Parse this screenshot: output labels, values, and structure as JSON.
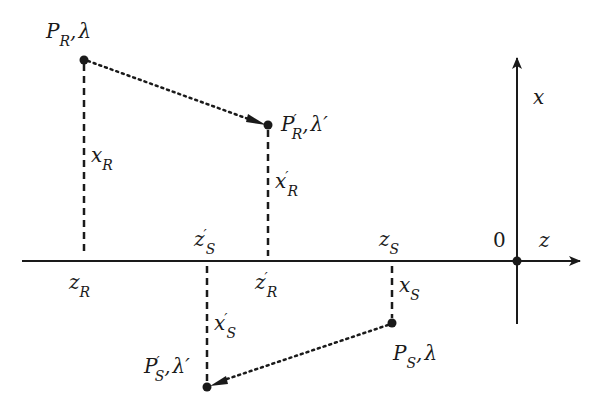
{
  "diagram": {
    "type": "coordinate-transform",
    "colors": {
      "ink": "#1a1a1a",
      "background": "#ffffff"
    },
    "axes": {
      "horizontal": {
        "label": "z"
      },
      "vertical": {
        "label": "x"
      },
      "origin": {
        "label": "0"
      }
    },
    "points": {
      "PR": {
        "base": "P",
        "prime": "",
        "sub": "R",
        "param": "λ"
      },
      "PRp": {
        "base": "P",
        "prime": "′",
        "sub": "R",
        "param": "λ′"
      },
      "PS": {
        "base": "P",
        "prime": "",
        "sub": "S",
        "param": "λ"
      },
      "PSp": {
        "base": "P",
        "prime": "′",
        "sub": "S",
        "param": "λ′"
      }
    },
    "coords": {
      "xR": {
        "base": "x",
        "prime": "",
        "sub": "R"
      },
      "xRp": {
        "base": "x",
        "prime": "′",
        "sub": "R"
      },
      "xS": {
        "base": "x",
        "prime": "",
        "sub": "S"
      },
      "xSp": {
        "base": "x",
        "prime": "′",
        "sub": "S"
      },
      "zR": {
        "base": "z",
        "prime": "",
        "sub": "R"
      },
      "zRp": {
        "base": "z",
        "prime": "′",
        "sub": "R"
      },
      "zS": {
        "base": "z",
        "prime": "",
        "sub": "S"
      },
      "zSp": {
        "base": "z",
        "prime": "′",
        "sub": "S"
      }
    },
    "separator": ","
  }
}
